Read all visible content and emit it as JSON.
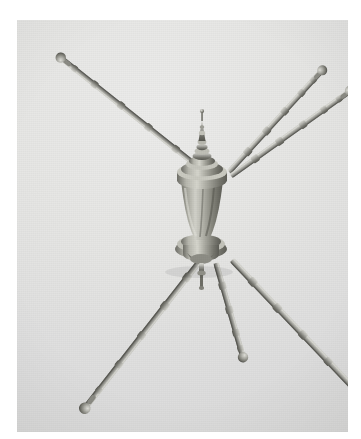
{
  "page": {
    "background_color": "#ffffff",
    "width": 361,
    "height": 439
  },
  "photograph": {
    "type": "black-and-white photograph",
    "subject": "antique metal telescoping stand with urn-shaped central body and segmented radiating arms and legs",
    "frame": {
      "left": 17,
      "top": 20,
      "width": 331,
      "height": 412
    },
    "background_tone": "#e3e3e1",
    "highlight_tone": "#ececea",
    "shadow_tone": "#d6d6d5",
    "caption": ""
  },
  "object": {
    "name": "telescoping tripod stand",
    "finish": "polished nickel / brass, tarnished",
    "metal_light": "#c9c9c4",
    "metal_mid": "#9a9a94",
    "metal_dark": "#6f6f6a",
    "metal_shadow": "#55554f",
    "parts": {
      "finial": {
        "label": "finial spire",
        "x": 202,
        "y": 127
      },
      "upper_hub": {
        "label": "upper collar hub",
        "x": 202,
        "y": 165
      },
      "urn_body": {
        "label": "urn body",
        "x": 202,
        "y": 205
      },
      "lower_hub": {
        "label": "lower flanged hub",
        "x": 201,
        "y": 250
      },
      "center_spike": {
        "label": "center drop spike",
        "x": 203,
        "y": 278
      }
    },
    "upper_arms": [
      {
        "id": "arm-upper-left",
        "tip_x": 32,
        "tip_y": 57,
        "segments": 5
      },
      {
        "id": "arm-upper-right-inner",
        "tip_x": 280,
        "tip_y": 53,
        "segments": 5
      },
      {
        "id": "arm-upper-right-outer",
        "tip_x": 311,
        "tip_y": 70,
        "segments": 5
      }
    ],
    "lower_legs": [
      {
        "id": "leg-lower-left",
        "foot_x": 57,
        "foot_y": 388,
        "segments": 5
      },
      {
        "id": "leg-lower-right",
        "foot_x": 330,
        "foot_y": 412,
        "segments": 6
      },
      {
        "id": "leg-center",
        "foot_x": 229,
        "foot_y": 344,
        "segments": 4
      }
    ],
    "tip_style": "ball knob finial"
  }
}
